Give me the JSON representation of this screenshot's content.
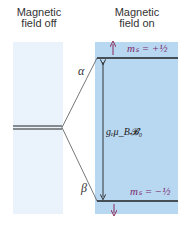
{
  "labels": {
    "left_title_line1": "Magnetic",
    "left_title_line2": "field off",
    "right_title_line1": "Magnetic",
    "right_title_line2": "field on"
  },
  "levels": {
    "alpha": "α",
    "beta": "β",
    "upper_ms": "mₛ = +½",
    "lower_ms": "mₛ = −½",
    "splitting": "gₑμ_B𝓑₀"
  },
  "colors": {
    "left_panel": "#eaf3fb",
    "right_panel": "#b8d7f1",
    "line": "#222222",
    "spin_arrow": "#8a2b5a",
    "ms_text": "#7a2a6a"
  }
}
